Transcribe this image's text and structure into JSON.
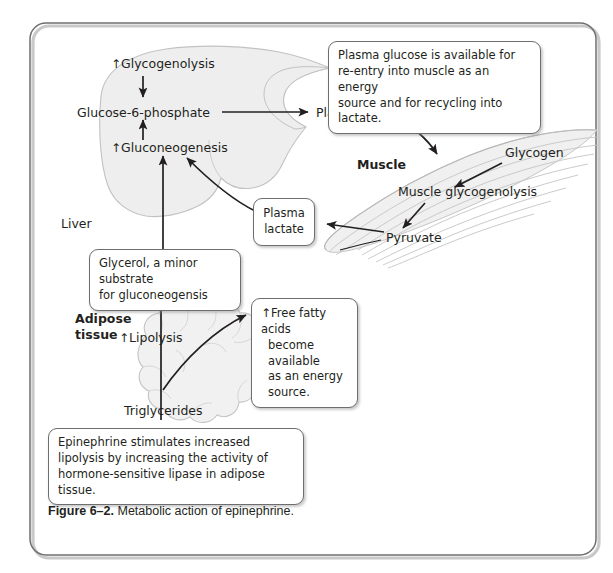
{
  "figure": {
    "number_label": "Figure 6–2.",
    "caption_text": " Metabolic action of epinephrine."
  },
  "organs": {
    "liver_label": "Liver",
    "muscle_label": "Muscle",
    "adipose_label_line1": "Adipose",
    "adipose_label_line2": "tissue"
  },
  "liver_nodes": {
    "glycogenolysis": "Glycogenolysis",
    "glucose6phosphate": "Glucose-6-phosphate",
    "gluconeogenesis": "Gluconeogenesis",
    "up_arrow": "↑"
  },
  "transport_nodes": {
    "plasma_glucose": "Plasma glucose",
    "plasma_lactate_line1": "Plasma",
    "plasma_lactate_line2": "lactate"
  },
  "muscle_nodes": {
    "glycogen": "Glycogen",
    "muscle_glycogenolysis": "Muscle glycogenolysis",
    "pyruvate": "Pyruvate"
  },
  "adipose_nodes": {
    "lipolysis": "Lipolysis",
    "triglycerides": "Triglycerides",
    "up_arrow": "↑"
  },
  "callouts": {
    "plasma_glucose_note": {
      "line1": "Plasma glucose is available for",
      "line2": "re-entry into muscle as an energy",
      "line3": "source and for recycling into lactate."
    },
    "glycerol_note": {
      "line1": "Glycerol, a minor substrate",
      "line2": "for gluconeogensis"
    },
    "free_fatty_acids_note": {
      "up_arrow": "↑",
      "line1": "Free fatty acids",
      "line2": "become available",
      "line3": "as an energy source."
    },
    "epinephrine_note": {
      "line1": "Epinephrine stimulates increased",
      "line2": "lipolysis by increasing the activity of",
      "line3": "hormone-sensitive lipase in adipose tissue."
    }
  },
  "colors": {
    "text": "#231f20",
    "organ_fill": "#eeeeee",
    "organ_stroke": "#b8b8b8",
    "box_stroke": "#6d6e70",
    "arrow": "#231f20",
    "frame": "#8c8c8c"
  }
}
